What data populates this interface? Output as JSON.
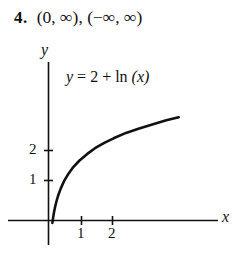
{
  "answer": {
    "number": "4.",
    "intervals": "(0, ∞), (−∞, ∞)"
  },
  "figure": {
    "equation_label": "y = 2 + ln (x)",
    "equation_lhs": "y",
    "equation_rel": " = 2 + ",
    "equation_fn": "ln",
    "equation_arg": " (x)",
    "y_axis_label": "y",
    "x_axis_label": "x"
  },
  "chart_data": {
    "type": "line",
    "title": "",
    "subtitle": "",
    "annotations": [
      "y = 2 + ln (x)"
    ],
    "xlabel": "x",
    "ylabel": "y",
    "xlim": [
      -1.4,
      6.2
    ],
    "ylim": [
      -0.9,
      5.3
    ],
    "xticks": [
      1,
      2
    ],
    "xtick_labels": [
      "1",
      "2"
    ],
    "yticks": [
      1,
      2
    ],
    "ytick_labels": [
      "1",
      "2"
    ],
    "grid": false,
    "legend": "none",
    "series": [
      {
        "name": "y = 2 + ln (x)",
        "color": "#111111",
        "x": [
          0.125,
          0.14,
          0.17,
          0.21,
          0.26,
          0.32,
          0.4,
          0.5,
          0.65,
          0.8,
          1.0,
          1.25,
          1.5,
          1.8,
          2.1,
          2.5,
          2.9,
          3.4,
          3.8,
          4.2
        ],
        "y": [
          -0.08,
          0.03,
          0.23,
          0.44,
          0.65,
          0.86,
          1.08,
          1.31,
          1.57,
          1.78,
          2.0,
          2.22,
          2.41,
          2.59,
          2.74,
          2.92,
          3.06,
          3.22,
          3.34,
          3.44
        ]
      }
    ]
  }
}
